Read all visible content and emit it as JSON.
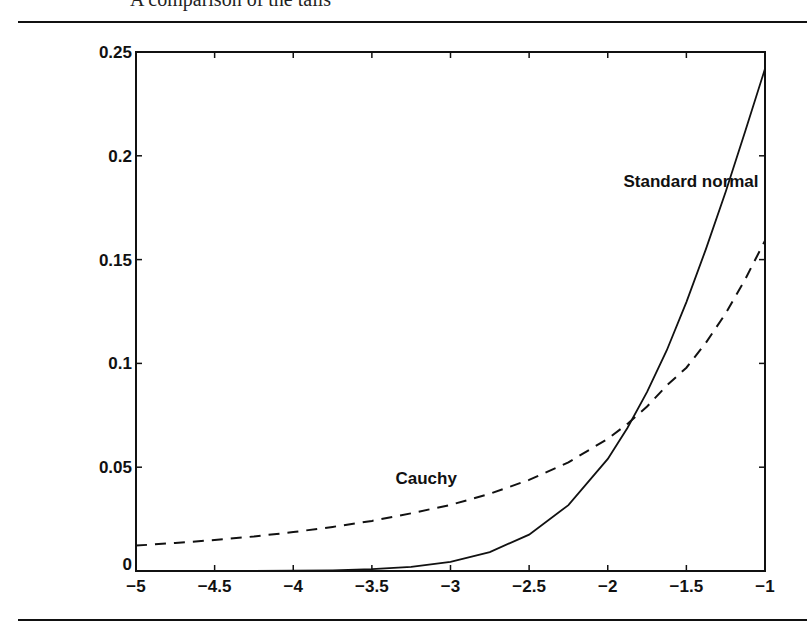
{
  "page": {
    "caption": "A comparison of the tails"
  },
  "chart_data": {
    "type": "line",
    "title": "",
    "xlabel": "",
    "ylabel": "",
    "xlim": [
      -5,
      -1
    ],
    "ylim": [
      0,
      0.25
    ],
    "grid": false,
    "legend": "inline labels",
    "x_ticks": [
      "-5",
      "-4.5",
      "-4",
      "-3.5",
      "-3",
      "-2.5",
      "-2",
      "-1.5",
      "-1"
    ],
    "y_ticks": [
      "0",
      "0.05",
      "0.1",
      "0.15",
      "0.2",
      "0.25"
    ],
    "x": [
      -5,
      -4.75,
      -4.5,
      -4.25,
      -4,
      -3.75,
      -3.5,
      -3.25,
      -3,
      -2.75,
      -2.5,
      -2.25,
      -2,
      -1.875,
      -1.75,
      -1.625,
      -1.5,
      -1.375,
      -1.25,
      -1.125,
      -1
    ],
    "series": [
      {
        "name": "Standard normal",
        "style": "solid",
        "values": [
          1.5e-06,
          5e-06,
          1.6e-05,
          4.9e-05,
          0.000134,
          0.000353,
          0.000873,
          0.002029,
          0.004432,
          0.009094,
          0.017528,
          0.03174,
          0.053991,
          0.0689,
          0.086277,
          0.106209,
          0.129518,
          0.155155,
          0.182649,
          0.211927,
          0.241971
        ]
      },
      {
        "name": "Cauchy",
        "style": "dashed",
        "values": [
          0.01224,
          0.01348,
          0.01493,
          0.01664,
          0.01872,
          0.02122,
          0.02411,
          0.0278,
          0.03183,
          0.03719,
          0.0439,
          0.05236,
          0.06366,
          0.07087,
          0.07925,
          0.08933,
          0.09794,
          0.11,
          0.12412,
          0.14063,
          0.15915
        ]
      }
    ],
    "annotations": [
      {
        "text": "Standard normal",
        "x": -1.9,
        "y": 0.185
      },
      {
        "text": "Cauchy",
        "x": -3.35,
        "y": 0.042
      }
    ]
  }
}
